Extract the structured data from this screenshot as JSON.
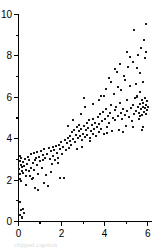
{
  "figure": {
    "background_color": "#ffffff",
    "axis_color": "#000000",
    "marker_color": "#1a1a1a",
    "caption_partial": "clipped caption"
  },
  "chart_data": {
    "type": "scatter",
    "title": "",
    "subtitle": "",
    "xlabel": "",
    "ylabel": "",
    "xlim": [
      0,
      6.2
    ],
    "ylim": [
      0,
      10
    ],
    "grid": false,
    "legend": null,
    "x_ticks_major": [
      0,
      2,
      4,
      6
    ],
    "x_ticks_minor": [
      1,
      3,
      5
    ],
    "y_ticks_major": [
      0,
      2,
      4,
      6,
      8,
      10
    ],
    "y_ticks_minor": [
      1,
      3,
      5,
      7,
      9
    ],
    "x_tick_labels": [
      "0",
      "2",
      "4",
      "6"
    ],
    "y_tick_labels": [
      "0",
      "2",
      "4",
      "6",
      "8",
      "10"
    ],
    "marker": "square",
    "marker_size_px": 2,
    "n_points": 208,
    "series": [
      {
        "name": "observations",
        "color": "#1a1a1a",
        "points": [
          [
            0.05,
            0.3
          ],
          [
            0.1,
            0.55
          ],
          [
            0.14,
            0.22
          ],
          [
            0.2,
            0.62
          ],
          [
            0.26,
            0.4
          ],
          [
            0.08,
            0.95
          ],
          [
            0.18,
            0.18
          ],
          [
            0.04,
            2.55
          ],
          [
            0.06,
            2.9
          ],
          [
            0.07,
            2.3
          ],
          [
            0.1,
            2.72
          ],
          [
            0.12,
            3.05
          ],
          [
            0.15,
            2.45
          ],
          [
            0.05,
            3.18
          ],
          [
            0.09,
            2.05
          ],
          [
            0.17,
            2.62
          ],
          [
            0.21,
            2.88
          ],
          [
            0.13,
            1.98
          ],
          [
            0.23,
            2.35
          ],
          [
            0.27,
            2.7
          ],
          [
            0.3,
            3.0
          ],
          [
            0.33,
            2.5
          ],
          [
            0.36,
            2.2
          ],
          [
            0.4,
            2.8
          ],
          [
            0.44,
            3.1
          ],
          [
            0.47,
            2.42
          ],
          [
            0.5,
            2.95
          ],
          [
            0.54,
            2.18
          ],
          [
            0.57,
            3.25
          ],
          [
            0.6,
            2.6
          ],
          [
            0.63,
            2.05
          ],
          [
            0.66,
            2.85
          ],
          [
            0.7,
            3.3
          ],
          [
            0.74,
            2.48
          ],
          [
            0.78,
            1.6
          ],
          [
            0.82,
            3.05
          ],
          [
            0.85,
            2.72
          ],
          [
            0.88,
            3.35
          ],
          [
            0.92,
            2.3
          ],
          [
            0.96,
            3.12
          ],
          [
            1.0,
            2.9
          ],
          [
            1.04,
            3.42
          ],
          [
            1.08,
            2.58
          ],
          [
            1.12,
            3.2
          ],
          [
            1.16,
            2.95
          ],
          [
            1.2,
            3.5
          ],
          [
            1.25,
            3.05
          ],
          [
            1.29,
            2.25
          ],
          [
            1.33,
            3.28
          ],
          [
            1.37,
            1.72
          ],
          [
            1.41,
            3.55
          ],
          [
            1.45,
            3.02
          ],
          [
            1.49,
            3.4
          ],
          [
            1.54,
            2.78
          ],
          [
            1.58,
            3.6
          ],
          [
            1.62,
            3.18
          ],
          [
            1.66,
            3.45
          ],
          [
            1.7,
            2.98
          ],
          [
            1.74,
            3.65
          ],
          [
            1.78,
            3.3
          ],
          [
            1.83,
            3.05
          ],
          [
            1.87,
            3.7
          ],
          [
            1.91,
            2.12
          ],
          [
            1.95,
            3.5
          ],
          [
            1.99,
            3.85
          ],
          [
            2.03,
            3.28
          ],
          [
            2.07,
            3.62
          ],
          [
            2.12,
            2.1
          ],
          [
            2.16,
            3.95
          ],
          [
            2.2,
            3.45
          ],
          [
            2.24,
            3.78
          ],
          [
            2.28,
            4.05
          ],
          [
            2.33,
            3.55
          ],
          [
            2.37,
            3.88
          ],
          [
            2.41,
            4.15
          ],
          [
            2.45,
            3.7
          ],
          [
            2.49,
            4.3
          ],
          [
            2.54,
            3.98
          ],
          [
            2.58,
            4.42
          ],
          [
            2.62,
            3.82
          ],
          [
            2.66,
            4.2
          ],
          [
            2.7,
            4.55
          ],
          [
            2.74,
            4.02
          ],
          [
            2.79,
            4.38
          ],
          [
            2.83,
            4.68
          ],
          [
            2.87,
            4.12
          ],
          [
            2.91,
            4.48
          ],
          [
            2.95,
            3.92
          ],
          [
            2.99,
            4.25
          ],
          [
            3.02,
            5.95
          ],
          [
            3.05,
            4.6
          ],
          [
            3.08,
            4.08
          ],
          [
            3.12,
            4.4
          ],
          [
            3.16,
            4.75
          ],
          [
            3.2,
            4.18
          ],
          [
            3.24,
            4.52
          ],
          [
            3.28,
            4.88
          ],
          [
            3.32,
            4.05
          ],
          [
            3.36,
            4.35
          ],
          [
            3.4,
            4.65
          ],
          [
            3.44,
            4.22
          ],
          [
            3.48,
            4.95
          ],
          [
            3.52,
            4.48
          ],
          [
            3.56,
            4.78
          ],
          [
            3.6,
            4.15
          ],
          [
            3.64,
            4.58
          ],
          [
            3.68,
            5.05
          ],
          [
            3.72,
            4.32
          ],
          [
            3.76,
            4.7
          ],
          [
            3.8,
            5.18
          ],
          [
            3.84,
            4.45
          ],
          [
            3.88,
            4.85
          ],
          [
            3.92,
            5.3
          ],
          [
            3.96,
            4.25
          ],
          [
            3.99,
            6.05
          ],
          [
            4.02,
            4.95
          ],
          [
            4.06,
            5.42
          ],
          [
            4.1,
            4.55
          ],
          [
            4.14,
            5.1
          ],
          [
            4.18,
            6.95
          ],
          [
            4.22,
            4.78
          ],
          [
            4.26,
            5.25
          ],
          [
            4.3,
            5.62
          ],
          [
            4.34,
            4.38
          ],
          [
            4.38,
            5.02
          ],
          [
            4.42,
            6.15
          ],
          [
            4.46,
            5.38
          ],
          [
            4.5,
            4.88
          ],
          [
            4.54,
            5.55
          ],
          [
            4.58,
            7.2
          ],
          [
            4.62,
            5.08
          ],
          [
            4.66,
            4.42
          ],
          [
            4.7,
            5.72
          ],
          [
            4.74,
            5.22
          ],
          [
            4.78,
            6.35
          ],
          [
            4.82,
            4.95
          ],
          [
            4.86,
            5.45
          ],
          [
            4.9,
            7.05
          ],
          [
            4.94,
            5.15
          ],
          [
            4.98,
            4.62
          ],
          [
            5.02,
            5.85
          ],
          [
            5.06,
            5.32
          ],
          [
            5.1,
            7.48
          ],
          [
            5.14,
            5.05
          ],
          [
            5.18,
            6.55
          ],
          [
            5.22,
            5.48
          ],
          [
            5.26,
            4.85
          ],
          [
            5.3,
            5.62
          ],
          [
            5.34,
            7.72
          ],
          [
            5.38,
            5.18
          ],
          [
            5.42,
            5.95
          ],
          [
            5.46,
            5.35
          ],
          [
            5.5,
            6.02
          ],
          [
            5.52,
            6.05
          ],
          [
            5.54,
            8.05
          ],
          [
            5.56,
            5.52
          ],
          [
            5.58,
            4.95
          ],
          [
            5.6,
            5.25
          ],
          [
            5.62,
            6.25
          ],
          [
            5.64,
            5.68
          ],
          [
            5.66,
            5.08
          ],
          [
            5.68,
            8.38
          ],
          [
            5.7,
            5.42
          ],
          [
            5.72,
            5.88
          ],
          [
            5.74,
            5.15
          ],
          [
            5.76,
            5.55
          ],
          [
            5.78,
            4.55
          ],
          [
            5.8,
            5.72
          ],
          [
            5.82,
            8.75
          ],
          [
            5.84,
            5.28
          ],
          [
            5.86,
            5.95
          ],
          [
            5.88,
            5.48
          ],
          [
            5.9,
            9.52
          ],
          [
            5.92,
            5.62
          ],
          [
            5.94,
            5.18
          ],
          [
            5.96,
            5.82
          ],
          [
            5.98,
            5.38
          ],
          [
            6.0,
            5.55
          ],
          [
            5.36,
            9.25
          ],
          [
            5.05,
            8.18
          ],
          [
            4.72,
            7.62
          ],
          [
            4.48,
            7.38
          ],
          [
            4.28,
            6.72
          ],
          [
            4.08,
            6.42
          ],
          [
            3.85,
            6.08
          ],
          [
            5.2,
            7.95
          ],
          [
            5.48,
            7.42
          ],
          [
            5.64,
            7.15
          ],
          [
            5.86,
            7.88
          ],
          [
            5.92,
            8.18
          ],
          [
            4.95,
            6.82
          ],
          [
            4.64,
            6.48
          ],
          [
            5.78,
            6.72
          ],
          [
            5.44,
            6.62
          ],
          [
            3.1,
            5.55
          ],
          [
            3.45,
            5.7
          ],
          [
            2.88,
            5.2
          ],
          [
            3.72,
            5.88
          ],
          [
            2.52,
            4.92
          ],
          [
            2.3,
            4.62
          ],
          [
            1.52,
            2.38
          ],
          [
            0.92,
            1.52
          ],
          [
            1.18,
            1.88
          ],
          [
            0.36,
            1.78
          ],
          [
            0.66,
            2.12
          ],
          [
            2.7,
            3.48
          ],
          [
            3.3,
            3.88
          ],
          [
            4.12,
            4.28
          ],
          [
            4.86,
            4.32
          ],
          [
            5.32,
            4.58
          ],
          [
            5.72,
            4.42
          ],
          [
            2.95,
            3.62
          ],
          [
            1.85,
            2.85
          ],
          [
            0.78,
            2.95
          ]
        ]
      }
    ]
  }
}
